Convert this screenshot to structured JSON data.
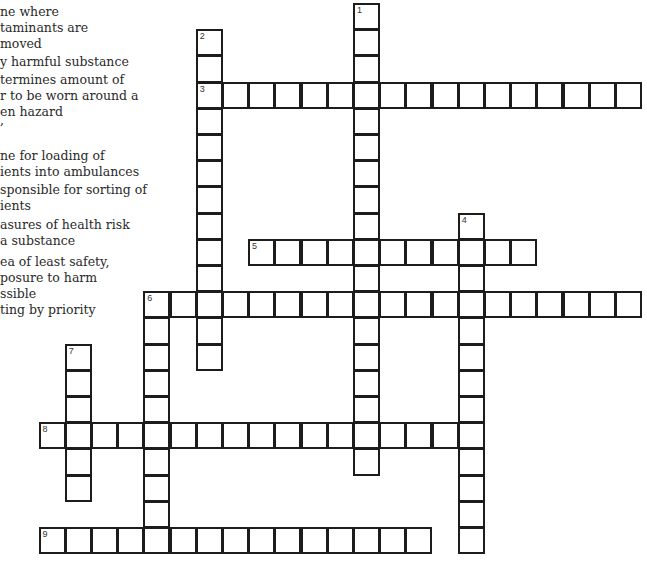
{
  "clues_panel": {
    "lines": [
      {
        "text": "ne where",
        "y": 4
      },
      {
        "text": "taminants are",
        "y": 20
      },
      {
        "text": "moved",
        "y": 36
      },
      {
        "text": "y harmful substance",
        "y": 54
      },
      {
        "text": "termines amount of",
        "y": 72
      },
      {
        "text": "r to be worn around a",
        "y": 88
      },
      {
        "text": "en hazard",
        "y": 104
      },
      {
        "text": ",",
        "y": 112
      },
      {
        "text": "ne for loading of",
        "y": 148
      },
      {
        "text": "ients into ambulances",
        "y": 164
      },
      {
        "text": "sponsible for sorting of",
        "y": 182
      },
      {
        "text": "ients",
        "y": 198
      },
      {
        "text": "asures of health risk",
        "y": 217
      },
      {
        "text": "a substance",
        "y": 233
      },
      {
        "text": "ea of least safety,",
        "y": 254
      },
      {
        "text": "posure to harm",
        "y": 270
      },
      {
        "text": "ssible",
        "y": 286
      },
      {
        "text": "ting by priority",
        "y": 302
      }
    ]
  },
  "grid": {
    "origin_x": 39.5,
    "origin_y": 4,
    "cell_size": 26.2,
    "border_color": "#1c1c1c",
    "words": [
      {
        "number": "1",
        "direction": "down",
        "row": 0,
        "col": 12,
        "length": 18
      },
      {
        "number": "2",
        "direction": "down",
        "row": 1,
        "col": 6,
        "length": 13
      },
      {
        "number": "3",
        "direction": "across",
        "row": 3,
        "col": 6,
        "length": 17
      },
      {
        "number": "4",
        "direction": "down",
        "row": 8,
        "col": 16,
        "length": 13
      },
      {
        "number": "5",
        "direction": "across",
        "row": 9,
        "col": 8,
        "length": 11
      },
      {
        "number": "6",
        "direction": "across",
        "row": 11,
        "col": 4,
        "length": 19
      },
      {
        "number": "6",
        "direction": "down",
        "row": 11,
        "col": 4,
        "length": 10
      },
      {
        "number": "7",
        "direction": "down",
        "row": 13,
        "col": 1,
        "length": 6
      },
      {
        "number": "8",
        "direction": "across",
        "row": 16,
        "col": 0,
        "length": 17
      },
      {
        "number": "9",
        "direction": "across",
        "row": 20,
        "col": 0,
        "length": 15
      }
    ]
  }
}
